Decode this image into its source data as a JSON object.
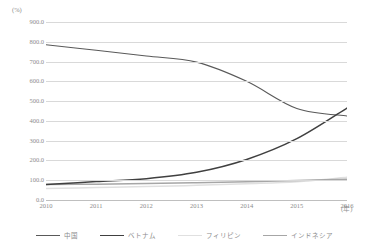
{
  "chart_data": {
    "type": "line",
    "title": "",
    "xlabel": "(年)",
    "ylabel": "(%)",
    "x": [
      2010,
      2011,
      2012,
      2013,
      2014,
      2015,
      2016
    ],
    "categories": [
      "2010",
      "2011",
      "2012",
      "2013",
      "2014",
      "2015",
      "2016"
    ],
    "ylim": [
      0,
      900
    ],
    "ytick_step": 100,
    "ytick_labels": [
      "900.0",
      "800.0",
      "700.0",
      "600.0",
      "500.0",
      "400.0",
      "300.0",
      "200.0",
      "100.0",
      "0.0"
    ],
    "ytick_values": [
      900,
      800,
      700,
      600,
      500,
      400,
      300,
      200,
      100,
      0
    ],
    "grid": true,
    "legend_position": "bottom",
    "series": [
      {
        "name": "中国",
        "color": "#595959",
        "width": 1.1,
        "values": [
          785,
          757,
          728,
          697,
          600,
          463,
          425
        ]
      },
      {
        "name": "ベトナム",
        "color": "#404040",
        "width": 1.5,
        "values": [
          78,
          93,
          108,
          140,
          205,
          310,
          465
        ]
      },
      {
        "name": "フィリピン",
        "color": "#e0e0e0",
        "width": 1.5,
        "values": [
          58,
          63,
          68,
          74,
          82,
          92,
          115
        ]
      },
      {
        "name": "インドネシア",
        "color": "#a6a6a6",
        "width": 1.5,
        "values": [
          78,
          80,
          83,
          87,
          92,
          98,
          105
        ]
      }
    ]
  }
}
